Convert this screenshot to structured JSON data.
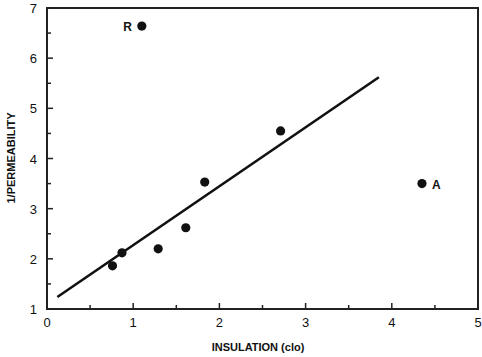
{
  "chart_data": {
    "type": "scatter",
    "title": "",
    "xlabel": "INSULATION (clo)",
    "ylabel": "1/PERMEABILITY",
    "xlim": [
      0,
      5
    ],
    "ylim": [
      1,
      7
    ],
    "x_ticks": [
      "0",
      "1",
      "2",
      "3",
      "4",
      "5"
    ],
    "y_ticks": [
      "1",
      "2",
      "3",
      "4",
      "5",
      "6",
      "7"
    ],
    "grid": false,
    "legend": null,
    "series": [
      {
        "name": "data",
        "points": [
          {
            "x": 1.1,
            "y": 6.64,
            "label": "R"
          },
          {
            "x": 0.76,
            "y": 1.86,
            "label": ""
          },
          {
            "x": 0.87,
            "y": 2.12,
            "label": ""
          },
          {
            "x": 1.29,
            "y": 2.2,
            "label": ""
          },
          {
            "x": 1.61,
            "y": 2.62,
            "label": ""
          },
          {
            "x": 1.83,
            "y": 3.53,
            "label": ""
          },
          {
            "x": 2.71,
            "y": 4.55,
            "label": ""
          },
          {
            "x": 4.35,
            "y": 3.5,
            "label": "A"
          }
        ]
      }
    ],
    "fit_line": {
      "x": [
        0.12,
        3.85
      ],
      "y": [
        1.24,
        5.62
      ]
    },
    "annotations": [
      "R",
      "A"
    ]
  }
}
